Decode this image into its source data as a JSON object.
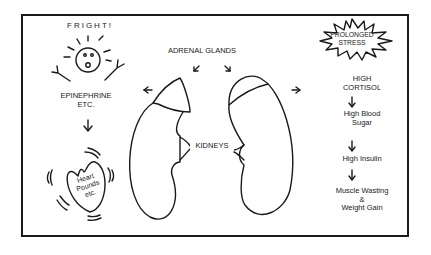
{
  "diagram": {
    "trigger": "FRIGHT!",
    "acute_response": {
      "hormone": [
        "EPINEPHRINE",
        "ETC."
      ],
      "effect": [
        "Heart",
        "Pounds",
        "etc."
      ]
    },
    "anatomy": {
      "glands_label": "ADRENAL GLANDS",
      "kidneys_label": "KIDNEYS"
    },
    "chronic_trigger": [
      "PROLONGED",
      "STRESS"
    ],
    "chronic_chain": [
      [
        "HIGH",
        "CORTISOL"
      ],
      [
        "High Blood",
        "Sugar"
      ],
      [
        "High Insulin"
      ],
      [
        "Muscle Wasting",
        "&",
        "Weight Gain"
      ]
    ],
    "arrow_glyph": "↓"
  },
  "colors": {
    "ink": "#1a1a1a",
    "background": "#ffffff"
  }
}
